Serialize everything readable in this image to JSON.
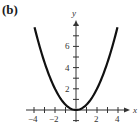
{
  "panel_label": "(b)",
  "chart_data": {
    "type": "line",
    "title": "(b)",
    "function": "y = x^2 / 2",
    "xlabel": "x",
    "ylabel": "y",
    "xlim": [
      -4.5,
      4.5
    ],
    "ylim": [
      -1,
      8.5
    ],
    "x_ticks": [
      -4,
      -3,
      -2,
      -1,
      1,
      2,
      3,
      4
    ],
    "x_tick_labels": [
      "-4",
      "-2",
      "2",
      "4"
    ],
    "y_ticks": [
      -1,
      1,
      2,
      3,
      4,
      5,
      6,
      7,
      8
    ],
    "y_tick_labels": [
      "2",
      "4",
      "6"
    ],
    "grid": false,
    "series": [
      {
        "name": "parabola",
        "x": [
          -4,
          -3,
          -2,
          -1,
          0,
          1,
          2,
          3,
          4
        ],
        "y": [
          8,
          4.5,
          2,
          0.5,
          0,
          0.5,
          2,
          4.5,
          8
        ]
      }
    ]
  }
}
